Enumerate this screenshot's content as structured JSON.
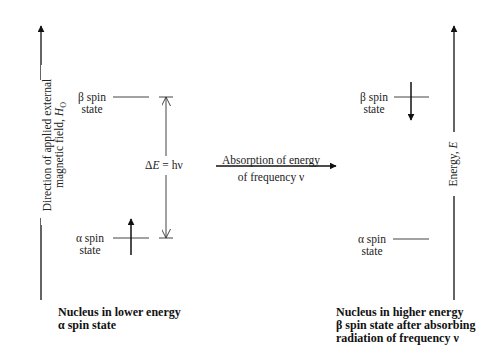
{
  "left_axis": {
    "label_line1": "Direction of applied external",
    "label_line2_prefix": "magnetic field, ",
    "label_line2_var": "H",
    "label_line2_sub": "O"
  },
  "right_axis": {
    "label_prefix": "Energy, ",
    "label_var": "E"
  },
  "left_panel": {
    "beta_label_line1": "β spin",
    "beta_label_line2": "state",
    "alpha_label_line1": "α spin",
    "alpha_label_line2": "state",
    "spin_arrow_direction": "up",
    "occupied_state": "alpha",
    "gap_label_prefix": "Δ",
    "gap_label_var": "E",
    "gap_label_suffix": " = hν",
    "caption_line1": "Nucleus in lower energy",
    "caption_line2": "α spin state"
  },
  "transition": {
    "label_line1": "Absorption of energy",
    "label_line2": "of frequency ν"
  },
  "right_panel": {
    "beta_label_line1": "β spin",
    "beta_label_line2": "state",
    "alpha_label_line1": "α spin",
    "alpha_label_line2": "state",
    "spin_arrow_direction": "down",
    "occupied_state": "beta",
    "caption_line1": "Nucleus in higher energy",
    "caption_line2": "β spin state after absorbing",
    "caption_line3": "radiation of frequency ν"
  },
  "colors": {
    "ink": "#1a1a1a",
    "background": "#ffffff"
  }
}
